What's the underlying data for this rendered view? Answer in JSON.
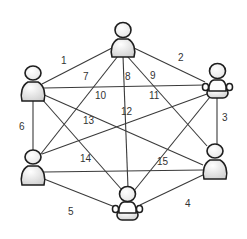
{
  "diagram": {
    "type": "complete-graph",
    "colors": {
      "line": "#3a3a3a",
      "outline": "#1e1e1e",
      "fill_light": "#ffffff",
      "fill_shade": "#cfcfcf"
    },
    "nodes": [
      {
        "id": "A",
        "position": "top",
        "pose": "standing"
      },
      {
        "id": "B",
        "position": "upper-left",
        "pose": "standing"
      },
      {
        "id": "C",
        "position": "upper-right",
        "pose": "seated"
      },
      {
        "id": "D",
        "position": "lower-left",
        "pose": "standing"
      },
      {
        "id": "E",
        "position": "lower-right",
        "pose": "standing"
      },
      {
        "id": "F",
        "position": "bottom",
        "pose": "seated"
      }
    ],
    "edges": [
      {
        "label": "1",
        "from": "A",
        "to": "B"
      },
      {
        "label": "2",
        "from": "A",
        "to": "C"
      },
      {
        "label": "3",
        "from": "C",
        "to": "E"
      },
      {
        "label": "4",
        "from": "E",
        "to": "F"
      },
      {
        "label": "5",
        "from": "F",
        "to": "D"
      },
      {
        "label": "6",
        "from": "B",
        "to": "D"
      },
      {
        "label": "7",
        "from": "A",
        "to": "D"
      },
      {
        "label": "8",
        "from": "A",
        "to": "F"
      },
      {
        "label": "9",
        "from": "A",
        "to": "E"
      },
      {
        "label": "10",
        "from": "B",
        "to": "C"
      },
      {
        "label": "11",
        "from": "C",
        "to": "D"
      },
      {
        "label": "12",
        "from": "D",
        "to": "E"
      },
      {
        "label": "13",
        "from": "B",
        "to": "E"
      },
      {
        "label": "14",
        "from": "B",
        "to": "F"
      },
      {
        "label": "15",
        "from": "C",
        "to": "F"
      }
    ]
  }
}
